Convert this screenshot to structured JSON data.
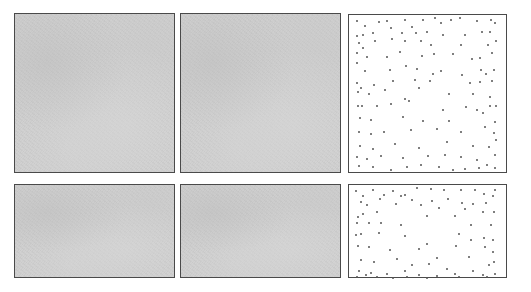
{
  "layout": {
    "rows": 2,
    "columns": 3,
    "panel_border_color": "#4a4a4a",
    "texture_color": "#cfcfcf",
    "dot_color": "#555555"
  },
  "panels": [
    {
      "id": "top-left",
      "type": "gray-texture",
      "x": 14,
      "y": 13,
      "w": 161,
      "h": 160
    },
    {
      "id": "top-middle",
      "type": "gray-texture",
      "x": 180,
      "y": 13,
      "w": 161,
      "h": 160
    },
    {
      "id": "top-right",
      "type": "dot-field",
      "x": 348,
      "y": 14,
      "w": 159,
      "h": 159
    },
    {
      "id": "bottom-left",
      "type": "gray-texture",
      "x": 14,
      "y": 184,
      "w": 161,
      "h": 94
    },
    {
      "id": "bottom-middle",
      "type": "gray-texture",
      "x": 180,
      "y": 184,
      "w": 161,
      "h": 94
    },
    {
      "id": "bottom-right",
      "type": "dot-field",
      "x": 348,
      "y": 184,
      "w": 159,
      "h": 94
    }
  ],
  "dot_fields": {
    "top-right": [
      [
        8,
        6
      ],
      [
        16,
        11
      ],
      [
        30,
        7
      ],
      [
        38,
        6
      ],
      [
        56,
        5
      ],
      [
        63,
        12
      ],
      [
        74,
        5
      ],
      [
        86,
        3
      ],
      [
        92,
        8
      ],
      [
        102,
        5
      ],
      [
        111,
        3
      ],
      [
        128,
        6
      ],
      [
        142,
        5
      ],
      [
        146,
        8
      ],
      [
        8,
        21
      ],
      [
        14,
        20
      ],
      [
        24,
        18
      ],
      [
        42,
        13
      ],
      [
        53,
        18
      ],
      [
        67,
        18
      ],
      [
        78,
        17
      ],
      [
        94,
        20
      ],
      [
        116,
        20
      ],
      [
        133,
        17
      ],
      [
        141,
        17
      ],
      [
        10,
        28
      ],
      [
        14,
        33
      ],
      [
        26,
        26
      ],
      [
        43,
        24
      ],
      [
        56,
        26
      ],
      [
        72,
        26
      ],
      [
        82,
        30
      ],
      [
        112,
        30
      ],
      [
        139,
        30
      ],
      [
        147,
        26
      ],
      [
        8,
        38
      ],
      [
        18,
        42
      ],
      [
        38,
        42
      ],
      [
        51,
        37
      ],
      [
        73,
        41
      ],
      [
        85,
        39
      ],
      [
        104,
        39
      ],
      [
        123,
        44
      ],
      [
        131,
        43
      ],
      [
        143,
        38
      ],
      [
        8,
        48
      ],
      [
        16,
        56
      ],
      [
        41,
        55
      ],
      [
        57,
        51
      ],
      [
        68,
        54
      ],
      [
        84,
        59
      ],
      [
        92,
        56
      ],
      [
        113,
        60
      ],
      [
        132,
        55
      ],
      [
        137,
        59
      ],
      [
        145,
        55
      ],
      [
        8,
        68
      ],
      [
        12,
        73
      ],
      [
        25,
        70
      ],
      [
        44,
        66
      ],
      [
        66,
        65
      ],
      [
        81,
        66
      ],
      [
        121,
        68
      ],
      [
        131,
        67
      ],
      [
        143,
        66
      ],
      [
        9,
        77
      ],
      [
        20,
        79
      ],
      [
        36,
        75
      ],
      [
        56,
        84
      ],
      [
        70,
        73
      ],
      [
        100,
        79
      ],
      [
        124,
        79
      ],
      [
        141,
        82
      ],
      [
        9,
        91
      ],
      [
        13,
        91
      ],
      [
        28,
        91
      ],
      [
        42,
        89
      ],
      [
        60,
        86
      ],
      [
        94,
        95
      ],
      [
        117,
        92
      ],
      [
        128,
        95
      ],
      [
        141,
        91
      ],
      [
        147,
        91
      ],
      [
        11,
        103
      ],
      [
        22,
        105
      ],
      [
        54,
        102
      ],
      [
        74,
        106
      ],
      [
        100,
        106
      ],
      [
        134,
        98
      ],
      [
        146,
        107
      ],
      [
        10,
        117
      ],
      [
        22,
        119
      ],
      [
        35,
        117
      ],
      [
        62,
        115
      ],
      [
        88,
        114
      ],
      [
        112,
        117
      ],
      [
        136,
        112
      ],
      [
        145,
        118
      ],
      [
        11,
        131
      ],
      [
        24,
        134
      ],
      [
        46,
        129
      ],
      [
        70,
        133
      ],
      [
        98,
        127
      ],
      [
        124,
        131
      ],
      [
        140,
        132
      ],
      [
        147,
        125
      ],
      [
        8,
        142
      ],
      [
        18,
        144
      ],
      [
        32,
        141
      ],
      [
        54,
        143
      ],
      [
        79,
        141
      ],
      [
        96,
        140
      ],
      [
        112,
        142
      ],
      [
        128,
        145
      ],
      [
        146,
        140
      ],
      [
        10,
        151
      ],
      [
        24,
        152
      ],
      [
        42,
        155
      ],
      [
        58,
        152
      ],
      [
        72,
        150
      ],
      [
        90,
        152
      ],
      [
        104,
        155
      ],
      [
        116,
        154
      ],
      [
        130,
        153
      ],
      [
        138,
        150
      ],
      [
        146,
        153
      ]
    ],
    "bottom-right": [
      [
        7,
        6
      ],
      [
        14,
        11
      ],
      [
        24,
        5
      ],
      [
        35,
        10
      ],
      [
        44,
        6
      ],
      [
        56,
        10
      ],
      [
        68,
        3
      ],
      [
        82,
        4
      ],
      [
        95,
        5
      ],
      [
        112,
        5
      ],
      [
        126,
        5
      ],
      [
        135,
        9
      ],
      [
        146,
        5
      ],
      [
        12,
        17
      ],
      [
        18,
        20
      ],
      [
        31,
        14
      ],
      [
        52,
        11
      ],
      [
        63,
        15
      ],
      [
        83,
        16
      ],
      [
        99,
        14
      ],
      [
        113,
        18
      ],
      [
        124,
        19
      ],
      [
        137,
        18
      ],
      [
        144,
        11
      ],
      [
        9,
        32
      ],
      [
        14,
        29
      ],
      [
        28,
        27
      ],
      [
        47,
        19
      ],
      [
        72,
        20
      ],
      [
        90,
        23
      ],
      [
        116,
        24
      ],
      [
        134,
        27
      ],
      [
        145,
        27
      ],
      [
        8,
        38
      ],
      [
        20,
        38
      ],
      [
        32,
        38
      ],
      [
        52,
        40
      ],
      [
        78,
        31
      ],
      [
        106,
        31
      ],
      [
        122,
        40
      ],
      [
        142,
        40
      ],
      [
        7,
        50
      ],
      [
        12,
        49
      ],
      [
        30,
        48
      ],
      [
        56,
        51
      ],
      [
        78,
        59
      ],
      [
        110,
        49
      ],
      [
        122,
        55
      ],
      [
        135,
        53
      ],
      [
        144,
        55
      ],
      [
        9,
        61
      ],
      [
        20,
        62
      ],
      [
        41,
        65
      ],
      [
        70,
        64
      ],
      [
        88,
        73
      ],
      [
        107,
        61
      ],
      [
        136,
        62
      ],
      [
        144,
        67
      ],
      [
        12,
        75
      ],
      [
        25,
        77
      ],
      [
        48,
        74
      ],
      [
        63,
        80
      ],
      [
        80,
        79
      ],
      [
        98,
        84
      ],
      [
        120,
        72
      ],
      [
        140,
        80
      ],
      [
        145,
        77
      ],
      [
        10,
        86
      ],
      [
        22,
        88
      ],
      [
        38,
        89
      ],
      [
        56,
        86
      ],
      [
        70,
        90
      ],
      [
        88,
        91
      ],
      [
        106,
        89
      ],
      [
        124,
        86
      ],
      [
        134,
        90
      ],
      [
        146,
        89
      ],
      [
        8,
        92
      ],
      [
        17,
        90
      ],
      [
        28,
        92
      ],
      [
        44,
        93
      ],
      [
        58,
        92
      ],
      [
        78,
        93
      ],
      [
        110,
        92
      ],
      [
        138,
        92
      ]
    ]
  }
}
